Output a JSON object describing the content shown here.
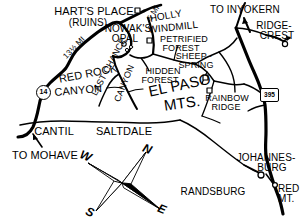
{
  "map": {
    "title": "El Paso Mountains / Red Rock Canyon Area Map",
    "ink_color": "#000000",
    "background_color": "#ffffff",
    "places": [
      {
        "id": "harts-place",
        "name": "HART'S PLACE",
        "sub": "(RUINS)",
        "x": 94,
        "y": 13
      },
      {
        "id": "nowaks-opal",
        "name": "NOWAK'S",
        "sub": "OPAL",
        "x": 123,
        "y": 29
      },
      {
        "id": "holly-windmill",
        "name": "HOLLY",
        "sub": "WINDMILL",
        "x": 172,
        "y": 22
      },
      {
        "id": "petrified-forest",
        "name": "PETRIFIED",
        "sub": "FOREST",
        "x": 184,
        "y": 41
      },
      {
        "id": "sheep-spring",
        "name": "SHEEP ·",
        "sub": "SPRING",
        "x": 196,
        "y": 57
      },
      {
        "id": "hidden-forest",
        "name": "HIDDEN",
        "sub": "FOREST",
        "x": 163,
        "y": 72
      },
      {
        "id": "ridgecrest",
        "name": "RIDGE-",
        "sub": "CREST",
        "x": 274,
        "y": 26
      },
      {
        "id": "rainbow-ridge",
        "name": "RAINBOW",
        "sub": "RIDGE",
        "x": 227,
        "y": 99
      },
      {
        "id": "johannesburg",
        "name": "JOHANNES-",
        "sub": "BURG",
        "x": 266,
        "y": 158
      },
      {
        "id": "randsburg",
        "name": "RANDSBURG",
        "sub": "",
        "x": 213,
        "y": 191
      },
      {
        "id": "red-mt",
        "name": "RED",
        "sub": "MT.",
        "x": 281,
        "y": 189
      },
      {
        "id": "cantil",
        "name": "CANTIL",
        "sub": "",
        "x": 54,
        "y": 130
      },
      {
        "id": "saltdale",
        "name": "SALTDALE",
        "sub": "",
        "x": 122,
        "y": 130
      }
    ],
    "area_labels": [
      {
        "id": "el-paso-mts",
        "line1": "EL PASO",
        "line2": "MTS.",
        "x": 174,
        "y": 88
      },
      {
        "id": "red-rock-canyon",
        "line1": "RED ROCK",
        "line2": "CANYON",
        "x": 82,
        "y": 74
      },
      {
        "id": "last-chance-canyon",
        "line1": "LAST CHANCE",
        "line2": "CANYON",
        "x": 112,
        "y": 92
      }
    ],
    "directions": [
      {
        "id": "to-inyokern",
        "label": "TO INYOKERN",
        "x": 245,
        "y": 9
      },
      {
        "id": "to-mohave",
        "label": "TO MOHAVE",
        "x": 40,
        "y": 154
      }
    ],
    "distances": [
      {
        "id": "dist-13-5",
        "label": "13½ MI",
        "x": 74,
        "y": 48
      },
      {
        "id": "dist-5",
        "label": "5 MI",
        "x": 150,
        "y": 14
      }
    ],
    "route_markers": [
      {
        "id": "route-14",
        "label": "14",
        "shape": "circle",
        "x": 38,
        "y": 90
      },
      {
        "id": "route-395",
        "label": "395",
        "shape": "shield",
        "x": 262,
        "y": 92
      }
    ],
    "compass": {
      "id": "compass-rose",
      "north": "N",
      "east": "E",
      "south": "S",
      "west": "W",
      "center_x": 122,
      "center_y": 183
    }
  }
}
